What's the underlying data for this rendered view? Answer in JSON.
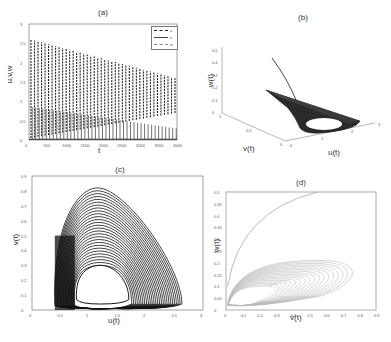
{
  "chart_data": [
    {
      "panel": "a",
      "type": "line",
      "title": "(a)",
      "xlabel": "t",
      "ylabel": "u,v,w",
      "xlim": [
        0,
        4000
      ],
      "ylim": [
        0,
        3
      ],
      "xticks": [
        "0",
        "500",
        "1000",
        "1500",
        "2000",
        "2500",
        "3000",
        "3500",
        "4000"
      ],
      "yticks": [
        "0",
        "0.5",
        "1",
        "1.5",
        "2",
        "2.5",
        "3"
      ],
      "legend": {
        "position": "upper right",
        "entries": [
          "u",
          "v",
          "w"
        ]
      },
      "series": [
        {
          "name": "u",
          "style": "dashed",
          "description": "oscillations with peaks decaying from ~2.6 at t=0 to ~1.6 at t=4000; troughs rising from ~0 to ~0.7"
        },
        {
          "name": "v",
          "style": "solid",
          "description": "oscillations with peaks decaying from ~0.8 to ~0.3"
        },
        {
          "name": "w",
          "style": "dash-dot",
          "description": "small-amplitude oscillations near 0"
        }
      ]
    },
    {
      "panel": "b",
      "type": "line",
      "title": "(b)",
      "xlabel": "u(t)",
      "ylabel": "v(t)",
      "zlabel": "w(t)",
      "xticks": [
        "0",
        "1",
        "2",
        "3"
      ],
      "yticks": [
        "0",
        "0.5",
        "1"
      ],
      "zticks": [
        "0",
        "0.1",
        "0.2",
        "0.3",
        "0.4",
        "0.5"
      ],
      "description": "3D phase portrait: a trajectory descends from w≈0.45 onto a torus-like attractor with a central hole"
    },
    {
      "panel": "c",
      "type": "line",
      "title": "(c)",
      "xlabel": "u(t)",
      "ylabel": "v(t)",
      "xlim": [
        0,
        3
      ],
      "ylim": [
        0,
        0.9
      ],
      "xticks": [
        "0",
        "0.5",
        "1",
        "1.5",
        "2",
        "2.5",
        "3"
      ],
      "yticks": [
        "0",
        "0.1",
        "0.2",
        "0.3",
        "0.4",
        "0.5",
        "0.6",
        "0.7",
        "0.8",
        "0.9"
      ],
      "description": "nested loops in u-v plane; outer loop peaks at v≈0.82 near u≈1.2, spans u≈0.4–2.6; inner hole spans u≈0.8–1.7, v≈0.03–0.3"
    },
    {
      "panel": "d",
      "type": "line",
      "title": "(d)",
      "xlabel": "v(t)",
      "ylabel": "w(t)",
      "xlim": [
        0,
        0.9
      ],
      "ylim": [
        0,
        0.5
      ],
      "xticks": [
        "0",
        "0.1",
        "0.2",
        "0.3",
        "0.4",
        "0.5",
        "0.6",
        "0.7",
        "0.8",
        "0.9"
      ],
      "yticks": [
        "0",
        "0.05",
        "0.1",
        "0.15",
        "0.2",
        "0.25",
        "0.3",
        "0.35",
        "0.4",
        "0.45",
        "0.5"
      ],
      "description": "v-w projection; transient curve rising from (0,0.1) to (0.55,0.5); attractor band between w≈0.02–0.21 spanning v≈0–0.82 with hole near v≈0.05–0.3, w≈0.03–0.1"
    }
  ],
  "panels": {
    "a": {
      "title": "(a)",
      "xlabel": "t",
      "ylabel": "u,v,w",
      "xticks": [
        "0",
        "500",
        "1000",
        "1500",
        "2000",
        "2500",
        "3000",
        "3500",
        "4000"
      ],
      "yticks": [
        "0",
        "0.5",
        "1",
        "1.5",
        "2",
        "2.5",
        "3"
      ],
      "legend": [
        "u",
        "v",
        "w"
      ]
    },
    "b": {
      "title": "(b)",
      "xlabel": "u(t)",
      "ylabel": "v(t)",
      "zlabel": "w(t)",
      "xticks": [
        "0",
        "1",
        "2",
        "3"
      ],
      "yticks": [
        "0",
        "0.5",
        "1"
      ],
      "zticks": [
        "0",
        "0.1",
        "0.2",
        "0.3",
        "0.4",
        "0.5"
      ]
    },
    "c": {
      "title": "(c)",
      "xlabel": "u(t)",
      "ylabel": "v(t)",
      "xticks": [
        "0",
        "0.5",
        "1",
        "1.5",
        "2",
        "2.5",
        "3"
      ],
      "yticks": [
        "0",
        "0.1",
        "0.2",
        "0.3",
        "0.4",
        "0.5",
        "0.6",
        "0.7",
        "0.8",
        "0.9"
      ]
    },
    "d": {
      "title": "(d)",
      "xlabel": "v(t)",
      "ylabel": "w(t)",
      "xticks": [
        "0",
        "0.1",
        "0.2",
        "0.3",
        "0.4",
        "0.5",
        "0.6",
        "0.7",
        "0.8",
        "0.9"
      ],
      "yticks": [
        "0",
        "0.05",
        "0.1",
        "0.15",
        "0.2",
        "0.25",
        "0.3",
        "0.35",
        "0.4",
        "0.45",
        "0.5"
      ]
    }
  },
  "colors": {
    "ink": "#1a1a1a",
    "light": "#aaaaaa",
    "axis": "#555555"
  }
}
